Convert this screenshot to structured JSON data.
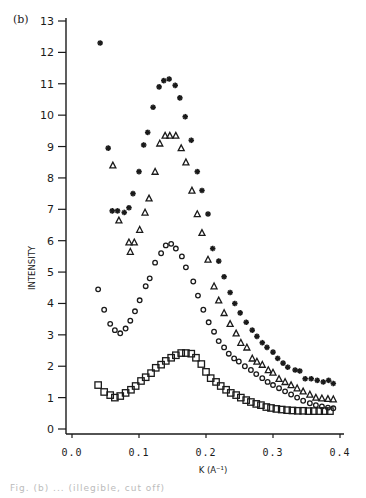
{
  "panel_label": "(b)",
  "caption": "Fig. (b) ... (illegible, cut off)",
  "chart_data": {
    "type": "scatter",
    "title": "",
    "panel": "(b)",
    "xlabel": "K (A⁻¹)",
    "ylabel": "INTENSITY",
    "xlim": [
      0.0,
      0.4
    ],
    "ylim": [
      0,
      13
    ],
    "xticks": [
      "0.0",
      "0.1",
      "0.2",
      "0.3",
      "0.4"
    ],
    "yticks": [
      "0",
      "1",
      "2",
      "3",
      "4",
      "5",
      "6",
      "7",
      "8",
      "9",
      "10",
      "11",
      "12",
      "13"
    ],
    "grid": false,
    "legend": "none",
    "series": [
      {
        "name": "stars",
        "marker": "asterisk",
        "x": [
          0.042,
          0.054,
          0.06,
          0.068,
          0.078,
          0.085,
          0.091,
          0.1,
          0.107,
          0.113,
          0.121,
          0.13,
          0.137,
          0.145,
          0.154,
          0.161,
          0.169,
          0.178,
          0.187,
          0.194,
          0.203,
          0.21,
          0.219,
          0.227,
          0.236,
          0.243,
          0.251,
          0.26,
          0.269,
          0.276,
          0.284,
          0.291,
          0.3,
          0.307,
          0.315,
          0.322,
          0.333,
          0.34,
          0.348,
          0.357,
          0.366,
          0.375,
          0.383,
          0.39
        ],
        "y": [
          12.3,
          8.95,
          6.95,
          6.95,
          6.9,
          7.05,
          7.5,
          8.2,
          9.05,
          9.45,
          10.25,
          10.9,
          11.1,
          11.15,
          10.95,
          10.55,
          9.95,
          9.2,
          8.2,
          7.6,
          6.85,
          5.75,
          5.35,
          4.85,
          4.35,
          4.0,
          3.7,
          3.4,
          3.15,
          2.95,
          2.75,
          2.6,
          2.45,
          2.25,
          2.1,
          1.97,
          1.88,
          1.85,
          1.6,
          1.6,
          1.55,
          1.5,
          1.55,
          1.45
        ]
      },
      {
        "name": "triangles",
        "marker": "triangle-open",
        "x": [
          0.061,
          0.07,
          0.085,
          0.087,
          0.093,
          0.101,
          0.109,
          0.115,
          0.124,
          0.131,
          0.139,
          0.146,
          0.155,
          0.163,
          0.17,
          0.179,
          0.187,
          0.194,
          0.203,
          0.212,
          0.219,
          0.227,
          0.236,
          0.245,
          0.252,
          0.261,
          0.269,
          0.276,
          0.284,
          0.293,
          0.3,
          0.309,
          0.318,
          0.327,
          0.336,
          0.345,
          0.355,
          0.364,
          0.373,
          0.382,
          0.39
        ],
        "y": [
          8.4,
          6.65,
          5.95,
          5.65,
          5.95,
          6.35,
          6.9,
          7.35,
          8.2,
          9.1,
          9.35,
          9.35,
          9.35,
          8.95,
          8.5,
          7.6,
          6.85,
          6.25,
          5.4,
          4.55,
          4.1,
          3.7,
          3.35,
          3.05,
          2.75,
          2.6,
          2.25,
          2.15,
          2.05,
          1.88,
          1.8,
          1.6,
          1.5,
          1.4,
          1.3,
          1.2,
          1.1,
          1.0,
          0.98,
          0.96,
          0.95
        ]
      },
      {
        "name": "diamonds",
        "marker": "diamond-open",
        "x": [
          0.039,
          0.048,
          0.057,
          0.064,
          0.072,
          0.08,
          0.087,
          0.094,
          0.101,
          0.11,
          0.116,
          0.124,
          0.133,
          0.14,
          0.148,
          0.155,
          0.164,
          0.17,
          0.181,
          0.188,
          0.196,
          0.204,
          0.212,
          0.219,
          0.227,
          0.234,
          0.242,
          0.249,
          0.258,
          0.267,
          0.275,
          0.284,
          0.292,
          0.3,
          0.309,
          0.318,
          0.327,
          0.336,
          0.345,
          0.355,
          0.364,
          0.373,
          0.382,
          0.39
        ],
        "y": [
          4.45,
          3.8,
          3.35,
          3.15,
          3.05,
          3.2,
          3.45,
          3.75,
          4.1,
          4.55,
          4.8,
          5.3,
          5.6,
          5.85,
          5.9,
          5.75,
          5.5,
          5.15,
          4.7,
          4.25,
          3.8,
          3.4,
          3.1,
          2.8,
          2.6,
          2.4,
          2.25,
          2.15,
          2.0,
          1.88,
          1.75,
          1.62,
          1.5,
          1.4,
          1.3,
          1.2,
          1.1,
          1.0,
          0.9,
          0.82,
          0.76,
          0.72,
          0.68,
          0.66
        ]
      },
      {
        "name": "squares",
        "marker": "square-open",
        "x": [
          0.039,
          0.048,
          0.057,
          0.064,
          0.072,
          0.08,
          0.088,
          0.095,
          0.103,
          0.11,
          0.118,
          0.125,
          0.133,
          0.14,
          0.148,
          0.155,
          0.163,
          0.17,
          0.178,
          0.185,
          0.193,
          0.2,
          0.207,
          0.215,
          0.222,
          0.23,
          0.237,
          0.245,
          0.252,
          0.26,
          0.267,
          0.275,
          0.282,
          0.29,
          0.297,
          0.305,
          0.313,
          0.321,
          0.329,
          0.337,
          0.345,
          0.353,
          0.361,
          0.369,
          0.377,
          0.385
        ],
        "y": [
          1.4,
          1.18,
          1.08,
          1.0,
          1.05,
          1.15,
          1.25,
          1.37,
          1.53,
          1.65,
          1.78,
          1.95,
          2.05,
          2.17,
          2.27,
          2.35,
          2.42,
          2.42,
          2.4,
          2.27,
          2.07,
          1.82,
          1.62,
          1.5,
          1.37,
          1.25,
          1.15,
          1.08,
          1.0,
          0.92,
          0.86,
          0.8,
          0.76,
          0.7,
          0.67,
          0.64,
          0.62,
          0.6,
          0.59,
          0.58,
          0.58,
          0.57,
          0.57,
          0.57,
          0.57,
          0.57
        ]
      }
    ]
  }
}
